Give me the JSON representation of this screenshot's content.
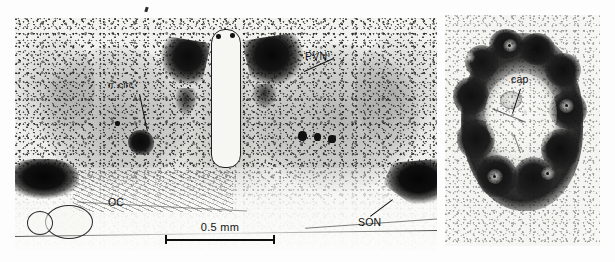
{
  "figure": {
    "type": "photomicrograph-figure",
    "modality": "brightfield light micrograph, silver/immunostained brain section",
    "panel_count": 2,
    "background_color": "#ffffff",
    "tissue_tone": "#e9e9e6",
    "stain_color": "#101010"
  },
  "panel_a": {
    "name": "low-magnification coronal hypothalamic section",
    "caption_labels": [
      {
        "id": "pvn",
        "text": "PVN",
        "role": "paraventricular nucleus",
        "has_leader": true,
        "leader_direction": "up-left"
      },
      {
        "id": "ncirc",
        "text": "n. circ",
        "role": "nucleus circularis",
        "has_leader": true,
        "leader_direction": "down"
      },
      {
        "id": "oc",
        "text": "OC",
        "role": "optic chiasm",
        "has_leader": false,
        "leader_direction": "none"
      },
      {
        "id": "son",
        "text": "SON",
        "role": "supraoptic nucleus",
        "has_leader": true,
        "leader_direction": "up-right"
      }
    ],
    "scalebar": {
      "label": "0.5 mm",
      "length_px": 105,
      "tick_style": "I-beam"
    },
    "structures": [
      "third ventricle (midline, vertical ovoid lumen)",
      "paraventricular nucleus, left and right (dark triangular cell clusters)",
      "nucleus circularis (small dark cluster, left side)",
      "supraoptic nucleus, left and right (large dark lateral masses)",
      "optic chiasm (striated fiber band, ventral midline)",
      "ventral blood vessel (round profile, lower left)"
    ]
  },
  "panel_b": {
    "name": "high-magnification nucleus detail",
    "caption_labels": [
      {
        "id": "cap",
        "text": "cap",
        "role": "capillary",
        "has_leader": true,
        "leader_direction": "down-right"
      }
    ],
    "structures": [
      "ring of densely stained magnocellular neurons",
      "central pale neuropil core",
      "capillary profile in core"
    ]
  }
}
